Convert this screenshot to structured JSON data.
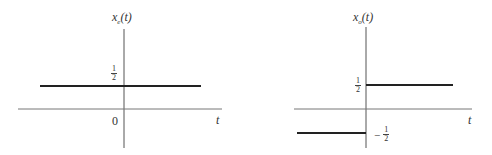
{
  "plots": [
    {
      "id": "left",
      "y_label": "x",
      "y_label_sub": "e",
      "y_label_arg": "(t)",
      "x_label": "t",
      "origin_label": "0",
      "level_label": {
        "num": "1",
        "den": "2"
      },
      "segments": [
        {
          "t_from": "-inf",
          "t_to": "inf",
          "value": 0.5
        }
      ]
    },
    {
      "id": "right",
      "y_label": "x",
      "y_label_sub": "o",
      "y_label_arg": "(t)",
      "x_label": "t",
      "upper_label": {
        "num": "1",
        "den": "2"
      },
      "lower_label": {
        "sign": "−",
        "num": "1",
        "den": "2"
      },
      "segments": [
        {
          "t_from": "-inf",
          "t_to": 0,
          "value": -0.5
        },
        {
          "t_from": 0,
          "t_to": "inf",
          "value": 0.5
        }
      ]
    }
  ],
  "colors": {
    "axis": "#555555",
    "signal": "#222222",
    "background": "#ffffff"
  }
}
